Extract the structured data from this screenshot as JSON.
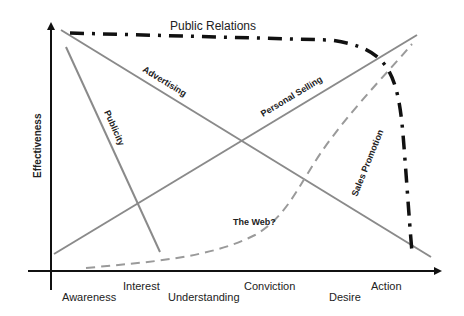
{
  "diagram": {
    "type": "effectiveness-vs-buying-stage",
    "y_axis_title": "Effectiveness",
    "x_axis_stages": [
      "Awareness",
      "Interest",
      "Understanding",
      "Conviction",
      "Desire",
      "Action"
    ],
    "colors": {
      "axis": "#111111",
      "gray_line": "#8a8a8a",
      "public_relations": "#111111",
      "web_dashed": "#9a9a9a",
      "text": "#222222"
    },
    "curves": [
      {
        "id": "public-relations",
        "label": "Public Relations",
        "style": "thick-dash-dot",
        "trend": "high and flat, drops sharply at Action"
      },
      {
        "id": "advertising",
        "label": "Advertising",
        "style": "solid-gray",
        "trend": "decreasing from high at Awareness to low at Action"
      },
      {
        "id": "personal-selling",
        "label": "Personal Selling",
        "style": "solid-gray",
        "trend": "increasing from low at Awareness to high at Action"
      },
      {
        "id": "publicity",
        "label": "Publicity",
        "style": "solid-gray",
        "trend": "steep decrease from Awareness to Interest"
      },
      {
        "id": "sales-promotion",
        "label": "Sales Promotion",
        "style": "label-only",
        "trend": ""
      },
      {
        "id": "the-web",
        "label": "The Web?",
        "style": "dashed-gray",
        "trend": "low, rising exponentially toward Action"
      }
    ]
  }
}
